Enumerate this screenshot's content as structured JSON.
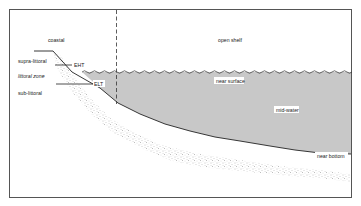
{
  "diagram": {
    "type": "marine-zonation-cross-section",
    "colors": {
      "frame": "#555555",
      "water": "#c8c8c8",
      "seabed_line": "#222222",
      "sediment_stipple": "#8a8a8a",
      "background": "#ffffff"
    },
    "labels": {
      "coastal": "coastal",
      "open_shelf": "open shelf",
      "supra_littoral": "supra-littoral",
      "littoral_zone": "littoral zone",
      "sub_littoral": "sub-littoral",
      "eht": "EHT",
      "elt": "ELT",
      "near_surface": "near surface",
      "mid_water": "mid-water",
      "near_bottom": "near bottom"
    }
  }
}
